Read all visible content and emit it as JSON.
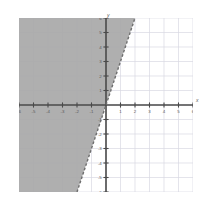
{
  "figure": {
    "kind": "coordinate-plane",
    "axis_letters": {
      "x": "x",
      "y": "y"
    },
    "background_color": "#ffffff",
    "grid_color": "#d8d8e2",
    "axis_color": "#4a4a4a",
    "shade_color": "#a8a8a8",
    "boundary_color": "#6e6e6e"
  },
  "chart_data": {
    "type": "line",
    "title": "",
    "subtitle": "",
    "xlabel": "x",
    "ylabel": "y",
    "grid": true,
    "legend": "none",
    "xlim": [
      -6,
      6
    ],
    "ylim": [
      -6,
      6
    ],
    "xticks": [
      -6,
      -5,
      -4,
      -3,
      -2,
      -1,
      1,
      2,
      3,
      4,
      5,
      6
    ],
    "yticks": [
      -6,
      -5,
      -4,
      -3,
      -2,
      -1,
      1,
      2,
      3,
      4,
      5,
      6
    ],
    "xticklabels": [
      "-6",
      "-5",
      "-4",
      "-3",
      "-2",
      "-1",
      "1",
      "2",
      "3",
      "4",
      "5",
      "6"
    ],
    "yticklabels": [
      "-6",
      "-5",
      "-4",
      "-3",
      "-2",
      "-1",
      "1",
      "2",
      "3",
      "4",
      "5",
      "6"
    ],
    "series": [
      {
        "name": "boundary",
        "kind": "line",
        "linestyle": "dashed",
        "slope": 3,
        "intercept": 0,
        "equation": "y = 3x",
        "x": [
          -2,
          2
        ],
        "y": [
          -6,
          6
        ],
        "color": "#6e6e6e"
      }
    ],
    "shaded_region": {
      "name": "solution-region",
      "description": "region to the left of / above the dashed boundary line",
      "inequality": "y > 3x",
      "boundary_included": false,
      "fill": "#a8a8a8",
      "polygon_xy": [
        [
          -6,
          -6
        ],
        [
          -2,
          -6
        ],
        [
          2,
          6
        ],
        [
          -6,
          6
        ]
      ]
    }
  }
}
